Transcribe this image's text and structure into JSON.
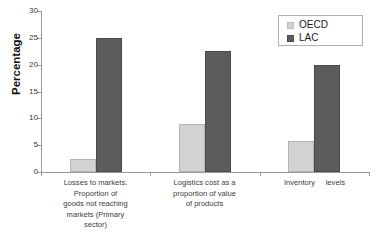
{
  "chart_data": {
    "type": "bar",
    "title": "",
    "xlabel": "",
    "ylabel": "Percentage",
    "ylim": [
      0,
      30
    ],
    "ytick_labels": [
      "30",
      "25",
      "20",
      "15",
      "10",
      "5",
      "0"
    ],
    "ytick_values": [
      30,
      25,
      20,
      15,
      10,
      5,
      0
    ],
    "grid": false,
    "legend_position": "top-right",
    "categories": [
      "Losses to markets. Proportion of goods not reaching markets (Primary sector)",
      "Logistics cost as a proportion of value of products",
      "Inventory     levels"
    ],
    "category_lines": [
      [
        "Losses to markets.",
        "Proportion of",
        "goods not reaching",
        "markets (Primary",
        "sector)"
      ],
      [
        "Logistics cost as a",
        "proportion of value",
        "of products"
      ],
      [
        "Inventory     levels"
      ]
    ],
    "series": [
      {
        "name": "OECD",
        "color": "#d2d2d2",
        "values": [
          2.5,
          9.0,
          5.7
        ]
      },
      {
        "name": "LAC",
        "color": "#5c5c5c",
        "values": [
          25.0,
          22.5,
          20.0
        ]
      }
    ]
  },
  "legend": {
    "items": [
      {
        "label": "OECD",
        "swatch": "legend-swatch-oecd"
      },
      {
        "label": "LAC",
        "swatch": "legend-swatch-lac"
      }
    ]
  },
  "axis": {
    "y_title": "Percentage"
  }
}
